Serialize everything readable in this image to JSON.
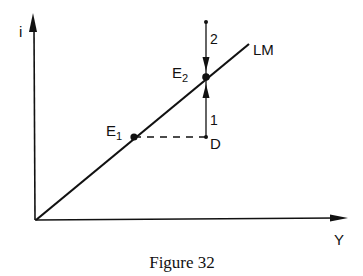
{
  "diagram": {
    "axes": {
      "y_label": "i",
      "x_label": "Y"
    },
    "curve": {
      "label": "LM"
    },
    "points": {
      "e1": {
        "label": "E",
        "sub": "1"
      },
      "e2": {
        "label": "E",
        "sub": "2"
      },
      "d": {
        "label": "D"
      }
    },
    "arrows": {
      "from_below": {
        "label": "1"
      },
      "from_above": {
        "label": "2"
      }
    },
    "caption": "Figure 32"
  }
}
